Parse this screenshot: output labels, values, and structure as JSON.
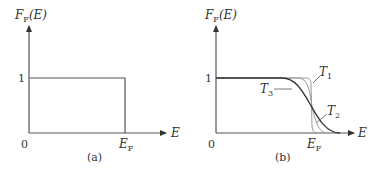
{
  "figure": {
    "panels": [
      {
        "id": "a",
        "caption": "(a)",
        "y_axis_label": "F",
        "y_axis_label_sub": "F",
        "y_axis_label_arg": "(E)",
        "x_axis_label": "E",
        "origin_label": "0",
        "y_tick_label": "1",
        "x_tick_label": "E",
        "x_tick_label_sub": "F",
        "description": "Step function at T = 0: F_F(E) = 1 for E < E_F, 0 for E > E_F"
      },
      {
        "id": "b",
        "caption": "(b)",
        "y_axis_label": "F",
        "y_axis_label_sub": "F",
        "y_axis_label_arg": "(E)",
        "x_axis_label": "E",
        "origin_label": "0",
        "y_tick_label": "1",
        "x_tick_label": "E",
        "x_tick_label_sub": "F",
        "curve_labels": [
          {
            "name": "T",
            "sub": "1"
          },
          {
            "name": "T",
            "sub": "2"
          },
          {
            "name": "T",
            "sub": "3"
          }
        ],
        "description": "Fermi-Dirac distribution at three temperatures T1 < T2 < T3, all crossing at E_F"
      }
    ],
    "colors": {
      "axis": "#555555",
      "curve_dark": "#333333",
      "curve_light": "#888888",
      "text": "#333333"
    }
  }
}
